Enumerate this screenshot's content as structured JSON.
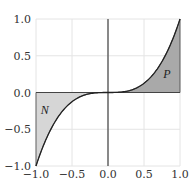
{
  "chart_data": {
    "type": "area",
    "title": "",
    "xlabel": "",
    "ylabel": "",
    "function": "y = x^3",
    "xlim": [
      -1.0,
      1.0
    ],
    "ylim": [
      -1.0,
      1.0
    ],
    "grid": true,
    "x_ticks": [
      -1.0,
      -0.5,
      0.0,
      0.5,
      1.0
    ],
    "y_ticks": [
      -1.0,
      -0.5,
      0.0,
      0.5,
      1.0
    ],
    "x_tick_labels": [
      "−1.0",
      "−0.5",
      "0.0",
      "0.5",
      "1.0"
    ],
    "y_tick_labels": [
      "−1.0",
      "−0.5",
      "0.0",
      "0.5",
      "1.0"
    ],
    "series": [
      {
        "name": "x^3",
        "x": [
          -1.0,
          -0.75,
          -0.5,
          -0.25,
          0.0,
          0.25,
          0.5,
          0.75,
          1.0
        ],
        "y": [
          -1.0,
          -0.422,
          -0.125,
          -0.016,
          0.0,
          0.016,
          0.125,
          0.422,
          1.0
        ]
      }
    ],
    "regions": [
      {
        "label": "N",
        "x_range": [
          -1.0,
          0.0
        ],
        "fill": "#d6d6d6",
        "label_pos": [
          -0.88,
          -0.24
        ]
      },
      {
        "label": "P",
        "x_range": [
          0.0,
          1.0
        ],
        "fill": "#a9a9a9",
        "label_pos": [
          0.82,
          0.25
        ]
      }
    ],
    "annotations": [
      "N",
      "P"
    ]
  },
  "style": {
    "curve_color": "#222222",
    "axis_color": "#444444",
    "grid_color": "#e4e4e4",
    "frame_color": "#cccccc"
  }
}
